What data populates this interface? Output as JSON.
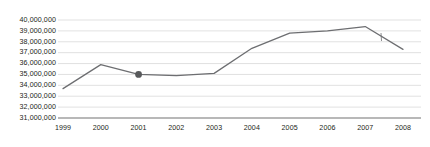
{
  "chart_data": {
    "type": "line",
    "title": "",
    "subtitle": "",
    "xlabel": "",
    "ylabel": "",
    "categories": [
      "1999",
      "2000",
      "2001",
      "2002",
      "2003",
      "2004",
      "2005",
      "2006",
      "2007",
      "2008"
    ],
    "series": [
      {
        "name": "",
        "values": [
          33700000,
          35900000,
          35000000,
          34900000,
          35100000,
          37400000,
          38800000,
          39000000,
          39400000,
          37300000
        ]
      }
    ],
    "ylim": [
      31000000,
      40000000
    ],
    "ytick_labels": [
      "40,000,000",
      "39,000,000",
      "38,000,000",
      "37,000,000",
      "36,000,000",
      "35,000,000",
      "34,000,000",
      "33,000,000",
      "32,000,000",
      "31,000,000"
    ],
    "ytick_values": [
      40000000,
      39000000,
      38000000,
      37000000,
      36000000,
      35000000,
      34000000,
      33000000,
      32000000,
      31000000
    ],
    "xtick_labels": [
      "1999",
      "2000",
      "2001",
      "2002",
      "2003",
      "2004",
      "2005",
      "2006",
      "2007",
      "2008"
    ],
    "grid": true,
    "grid_axis": "y",
    "legend": false,
    "legend_position": "none",
    "markers": [
      {
        "category": "2001",
        "value": 35000000,
        "style": "filled-circle"
      }
    ],
    "annotations": [
      {
        "name": "tick-mark-2008",
        "description": "small vertical tick near 2008 descent"
      }
    ],
    "colors": {
      "line": "#6d6e71",
      "marker": "#58595b",
      "grid": "#d9d9d9",
      "axis": "#808080",
      "text": "#231f20",
      "background": "#ffffff"
    }
  }
}
